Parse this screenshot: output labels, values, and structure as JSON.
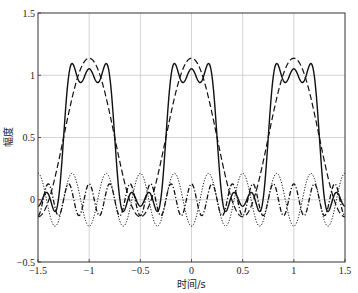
{
  "chart_data": {
    "type": "line",
    "title": "",
    "xlabel": "时间/s",
    "ylabel": "幅度",
    "xlim": [
      -1.5,
      1.5
    ],
    "ylim": [
      -0.5,
      1.5
    ],
    "grid": true,
    "legend": null,
    "x_ticks": [
      -1.5,
      -1,
      -0.5,
      0,
      0.5,
      1,
      1.5
    ],
    "x_tick_labels": [
      "−1.5",
      "−1",
      "−0.5",
      "0",
      "0.5",
      "1",
      "1.5"
    ],
    "y_ticks": [
      -0.5,
      0,
      0.5,
      1,
      1.5
    ],
    "y_tick_labels": [
      "−0.5",
      "0",
      "0.5",
      "1",
      "1.5"
    ],
    "harmonics": {
      "dc": 0.5,
      "fundamental": {
        "amplitude": 0.6366,
        "freq": 1
      },
      "third": {
        "amplitude": -0.2122,
        "freq": 3
      },
      "fifth": {
        "amplitude": 0.1273,
        "freq": 5
      }
    },
    "x": [
      -0.5,
      -0.45,
      -0.4,
      -0.35,
      -0.3,
      -0.25,
      -0.2,
      -0.15,
      -0.1,
      -0.05,
      0,
      0.05,
      0.1,
      0.15,
      0.2,
      0.25,
      0.3,
      0.35,
      0.4,
      0.45,
      0.5
    ],
    "x_note": "values repeat with period 1 across [-1.5, 1.5]",
    "series": [
      {
        "name": "DC + 1st + 3rd + 5th harmonics",
        "style": "solid",
        "terms": [
          "dc",
          "fundamental",
          "third",
          "fifth"
        ],
        "values": [
          -0.052,
          0.019,
          0.047,
          -0.076,
          0.004,
          0.5,
          0.996,
          1.076,
          0.953,
          0.981,
          1.052,
          0.981,
          0.953,
          1.076,
          0.996,
          0.5,
          0.004,
          -0.076,
          0.047,
          0.019,
          -0.052
        ]
      },
      {
        "name": "DC + fundamental",
        "style": "dashed",
        "terms": [
          "dc",
          "fundamental"
        ],
        "values": [
          -0.137,
          -0.106,
          -0.015,
          0.126,
          0.303,
          0.5,
          0.697,
          0.874,
          1.015,
          1.106,
          1.137,
          1.106,
          1.015,
          0.874,
          0.697,
          0.5,
          0.303,
          0.126,
          -0.015,
          -0.106,
          -0.137
        ]
      },
      {
        "name": "3rd harmonic",
        "style": "dotted",
        "terms": [
          "third"
        ],
        "values": [
          0.212,
          0.125,
          -0.066,
          -0.202,
          -0.172,
          0,
          0.172,
          0.202,
          0.066,
          -0.125,
          -0.212,
          -0.125,
          0.066,
          0.202,
          0.172,
          0,
          -0.172,
          -0.202,
          -0.066,
          0.125,
          0.212
        ]
      },
      {
        "name": "5th harmonic",
        "style": "dash-dot",
        "terms": [
          "fifth"
        ],
        "values": [
          -0.127,
          0,
          0.127,
          0,
          -0.127,
          0,
          0.127,
          0,
          -0.127,
          0,
          0.127,
          0,
          -0.127,
          0,
          0.127,
          0,
          -0.127,
          0,
          0.127,
          0,
          -0.127
        ]
      }
    ]
  },
  "colors": {
    "line": "#111111",
    "grid": "#c8c8c8",
    "axes": "#333333",
    "background": "#ffffff"
  }
}
